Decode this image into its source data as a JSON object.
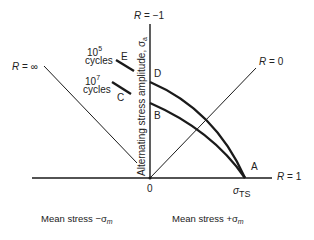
{
  "diagram": {
    "type": "Haigh diagram (alternating vs mean stress)",
    "lines": {
      "r_minus1": "R = −1",
      "r_inf": "R = ∞",
      "r_zero": "R = 0",
      "r_one": "R = 1"
    },
    "r_prefix": "R",
    "r_minus1_val": " = −1",
    "r_inf_val": " = ∞",
    "r_zero_val": " = 0",
    "r_one_val": " = 1",
    "y_axis_label": "Alternating stress amplitude, σ",
    "y_axis_sub": "a",
    "origin": "0",
    "sigma_ts": "σ",
    "sigma_ts_sub": "TS",
    "points": {
      "A": "A",
      "B": "B",
      "C": "C",
      "D": "D",
      "E": "E"
    },
    "cycles_high": {
      "base": "10",
      "exp": "5",
      "label": "cycles"
    },
    "cycles_low": {
      "base": "10",
      "exp": "7",
      "label": "cycles"
    },
    "x_neg_label": "Mean stress  −σ",
    "x_neg_sub": "m",
    "x_pos_label": "Mean stress +σ",
    "x_pos_sub": "m",
    "line_color": "#1a1a1a"
  }
}
